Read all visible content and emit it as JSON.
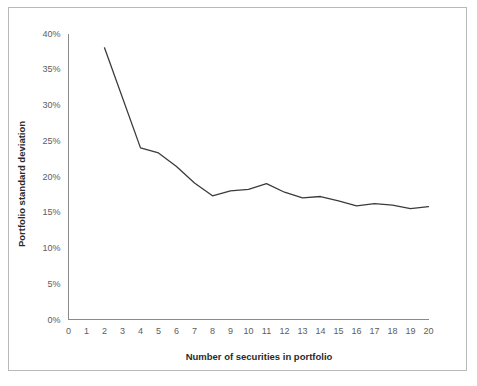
{
  "figure": {
    "border_color": "#b9b9b9",
    "background": "#ffffff"
  },
  "chart_data": {
    "type": "line",
    "title": "",
    "subtitle": "",
    "xlabel": "Number of securities in portfolio",
    "ylabel": "Portfolio standard deviation",
    "xlim": [
      0,
      20
    ],
    "ylim": [
      0,
      40
    ],
    "xticks": [
      0,
      1,
      2,
      3,
      4,
      5,
      6,
      7,
      8,
      9,
      10,
      11,
      12,
      13,
      14,
      15,
      16,
      17,
      18,
      19,
      20
    ],
    "xtick_labels": [
      "0",
      "1",
      "2",
      "3",
      "4",
      "5",
      "6",
      "7",
      "8",
      "9",
      "10",
      "11",
      "12",
      "13",
      "14",
      "15",
      "16",
      "17",
      "18",
      "19",
      "20"
    ],
    "yticks": [
      0,
      5,
      10,
      15,
      20,
      25,
      30,
      35,
      40
    ],
    "ytick_labels": [
      "0%",
      "5%",
      "10%",
      "15%",
      "20%",
      "25%",
      "30%",
      "35%",
      "40%"
    ],
    "grid": false,
    "legend": null,
    "legend_position": "none",
    "line_color": "#3b3b3b",
    "axis_color": "#8a8a8a",
    "tick_label_color": "#5d5d5d",
    "x": [
      2,
      4,
      5,
      6,
      7,
      8,
      9,
      10,
      11,
      12,
      13,
      14,
      15,
      16,
      17,
      18,
      19,
      20
    ],
    "values": [
      38.0,
      24.0,
      23.3,
      21.4,
      19.1,
      17.3,
      18.0,
      18.2,
      19.0,
      17.8,
      17.0,
      17.2,
      16.6,
      15.9,
      16.2,
      16.0,
      15.5,
      15.8
    ],
    "series": [
      {
        "name": "Portfolio standard deviation",
        "values": [
          38.0,
          24.0,
          23.3,
          21.4,
          19.1,
          17.3,
          18.0,
          18.2,
          19.0,
          17.8,
          17.0,
          17.2,
          16.6,
          15.9,
          16.2,
          16.0,
          15.5,
          15.8
        ]
      }
    ],
    "annotations": []
  }
}
